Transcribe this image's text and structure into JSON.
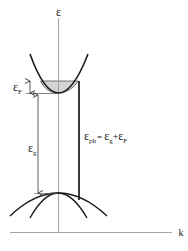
{
  "diagram": {
    "type": "band-structure",
    "axes": {
      "y_label": "ε",
      "x_label": "k"
    },
    "labels": {
      "fermi": {
        "main": "ε",
        "sub": "F"
      },
      "gap": {
        "main": "ε",
        "sub": "g"
      },
      "photon": {
        "lhs_main": "ε",
        "lhs_sub": "ph",
        "eq": "=",
        "t1_main": "ε",
        "t1_sub": "g",
        "plus": "+",
        "t2_main": "ε",
        "t2_sub": "F"
      }
    },
    "elements": [
      "conduction-band (parabola, filled up to Fermi level)",
      "valence-bands (two downward parabolas, heavy and light)",
      "fermi-level arrow",
      "band-gap arrow",
      "vertical optical transition line"
    ],
    "colors": {
      "line": "#1a1a1a",
      "axis": "#9a9a9a",
      "fill": "#d4d4d4"
    }
  }
}
